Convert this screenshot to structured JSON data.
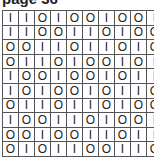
{
  "title": "page 36",
  "grid": {
    "rows": [
      [
        "I",
        "I",
        "O",
        "I",
        "O",
        "O",
        "I",
        "O",
        "O",
        "I"
      ],
      [
        "I",
        "I",
        "O",
        "O",
        "I",
        "I",
        "O",
        "I",
        "O",
        "O"
      ],
      [
        "O",
        "O",
        "I",
        "I",
        "O",
        "I",
        "I",
        "O",
        "I",
        "O"
      ],
      [
        "O",
        "I",
        "I",
        "O",
        "I",
        "O",
        "O",
        "I",
        "O",
        "I"
      ],
      [
        "I",
        "O",
        "O",
        "I",
        "O",
        "O",
        "I",
        "O",
        "I",
        "I"
      ],
      [
        "I",
        "O",
        "I",
        "O",
        "O",
        "I",
        "O",
        "I",
        "I",
        "O"
      ],
      [
        "O",
        "I",
        "I",
        "O",
        "I",
        "I",
        "O",
        "I",
        "O",
        "O"
      ],
      [
        "I",
        "O",
        "O",
        "I",
        "I",
        "O",
        "I",
        "O",
        "O",
        "I"
      ],
      [
        "O",
        "O",
        "I",
        "O",
        "O",
        "I",
        "I",
        "O",
        "I",
        "I"
      ],
      [
        "O",
        "I",
        "O",
        "I",
        "I",
        "O",
        "O",
        "I",
        "I",
        "O"
      ]
    ]
  }
}
